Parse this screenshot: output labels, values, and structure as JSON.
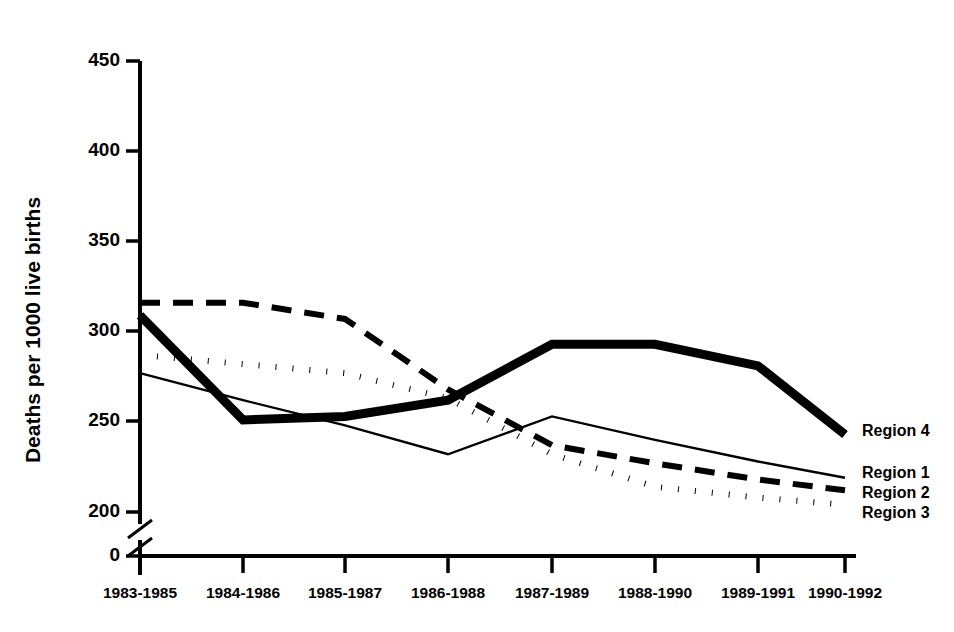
{
  "chart_data": {
    "type": "line",
    "title": "",
    "xlabel": "",
    "ylabel": "Deaths per 1000 live births",
    "categories": [
      "1983-1985",
      "1984-1986",
      "1985-1987",
      "1986-1988",
      "1987-1989",
      "1988-1990",
      "1989-1991",
      "1990-1992"
    ],
    "ylim": [
      200,
      450
    ],
    "yticks": [
      200,
      250,
      300,
      350,
      400,
      450
    ],
    "ytick_labels": [
      "200",
      "250",
      "300",
      "350",
      "400",
      "450"
    ],
    "y_axis_break": true,
    "y_axis_break_label": "0",
    "grid": false,
    "legend_position": "right-inline",
    "series": [
      {
        "name": "Region 4",
        "style": "thick-solid",
        "values": [
          309,
          251,
          253,
          262,
          293,
          293,
          281,
          243
        ]
      },
      {
        "name": "Region 1",
        "style": "thin-solid",
        "values": [
          277,
          262,
          248,
          232,
          253,
          240,
          228,
          219
        ]
      },
      {
        "name": "Region 2",
        "style": "dashed",
        "values": [
          316,
          316,
          307,
          268,
          237,
          227,
          218,
          212
        ]
      },
      {
        "name": "Region 3",
        "style": "dotted",
        "values": [
          287,
          282,
          277,
          263,
          232,
          214,
          208,
          204
        ]
      }
    ]
  },
  "legend": {
    "entries": [
      {
        "label": "Region 4"
      },
      {
        "label": "Region 1"
      },
      {
        "label": "Region 2"
      },
      {
        "label": "Region 3"
      }
    ]
  },
  "colors": {
    "ink": "#000000",
    "background": "#ffffff"
  }
}
